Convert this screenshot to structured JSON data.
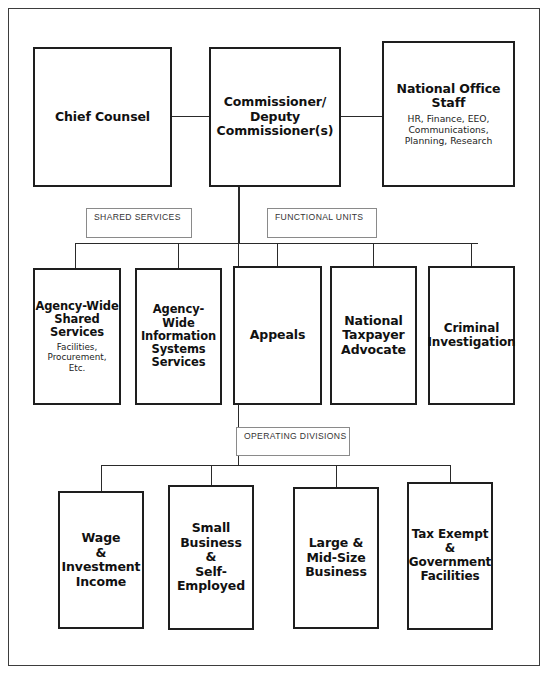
{
  "chart": {
    "type": "org-chart",
    "width": 548,
    "height": 675,
    "colors": {
      "box_border": "#1e1e1e",
      "frame_border": "#3d3d3d",
      "line": "#2a2a2a",
      "label_border": "#8a8a8a",
      "label_text": "#343434",
      "background": "#ffffff",
      "text": "#111111"
    }
  },
  "levels": {
    "executive": {
      "nodes": [
        {
          "id": "chief-counsel",
          "title": "Chief Counsel",
          "subtitle": "",
          "x": 33,
          "y": 47,
          "w": 139,
          "h": 140
        },
        {
          "id": "commissioner",
          "title": "Commissioner/\nDeputy\nCommissioner(s)",
          "subtitle": "",
          "x": 209,
          "y": 47,
          "w": 132,
          "h": 140
        },
        {
          "id": "national-office-staff",
          "title": "National Office\nStaff",
          "subtitle": "HR, Finance, EEO,\nCommunications,\nPlanning, Research",
          "x": 382,
          "y": 41,
          "w": 133,
          "h": 146
        }
      ]
    },
    "units": {
      "bus_labels": [
        {
          "id": "shared-services",
          "text": "SHARED SERVICES",
          "x": 86,
          "y": 208,
          "w": 106,
          "h": 30
        },
        {
          "id": "functional-units",
          "text": "FUNCTIONAL UNITS",
          "x": 267,
          "y": 208,
          "w": 110,
          "h": 30
        }
      ],
      "nodes": [
        {
          "id": "agency-wide-shared-services",
          "title": "Agency-Wide\nShared\nServices",
          "subtitle": "Facilities,\nProcurement,\nEtc.",
          "x": 33,
          "y": 268,
          "w": 88,
          "h": 137
        },
        {
          "id": "agency-wide-information-systems-services",
          "title": "Agency-Wide\nInformation\nSystems\nServices",
          "subtitle": "",
          "x": 135,
          "y": 268,
          "w": 87,
          "h": 137
        },
        {
          "id": "appeals",
          "title": "Appeals",
          "subtitle": "",
          "x": 233,
          "y": 266,
          "w": 89,
          "h": 139
        },
        {
          "id": "national-taxpayer-advocate",
          "title": "National\nTaxpayer\nAdvocate",
          "subtitle": "",
          "x": 330,
          "y": 266,
          "w": 87,
          "h": 139
        },
        {
          "id": "criminal-investigation",
          "title": "Criminal\nInvestigation",
          "subtitle": "",
          "x": 428,
          "y": 266,
          "w": 87,
          "h": 139
        }
      ]
    },
    "divisions": {
      "bus_labels": [
        {
          "id": "operating-divisions",
          "text": "OPERATING DIVISIONS",
          "x": 236,
          "y": 427,
          "w": 114,
          "h": 29
        }
      ],
      "nodes": [
        {
          "id": "wage-investment-income",
          "title": "Wage\n&\nInvestment\nIncome",
          "subtitle": "",
          "x": 58,
          "y": 491,
          "w": 86,
          "h": 138
        },
        {
          "id": "small-business-self-employed",
          "title": "Small\nBusiness\n&\nSelf-\nEmployed",
          "subtitle": "",
          "x": 168,
          "y": 485,
          "w": 86,
          "h": 145
        },
        {
          "id": "large-mid-size-business",
          "title": "Large &\nMid-Size\nBusiness",
          "subtitle": "",
          "x": 293,
          "y": 487,
          "w": 86,
          "h": 142
        },
        {
          "id": "tax-exempt-government-facilities",
          "title": "Tax Exempt\n&\nGovernment\nFacilities",
          "subtitle": "",
          "x": 407,
          "y": 482,
          "w": 86,
          "h": 148
        }
      ]
    }
  },
  "connectors": {
    "description": "Lines joining Commissioner to the functional-unit bus and the operating-division bus"
  }
}
